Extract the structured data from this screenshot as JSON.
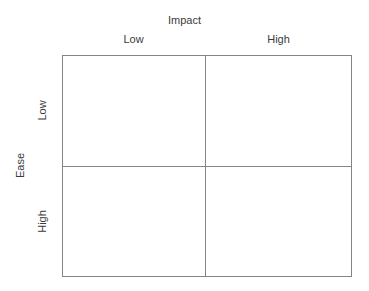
{
  "chart_data": {
    "type": "table",
    "title": "",
    "xlabel": "Impact",
    "ylabel": "Ease",
    "x_categories": [
      "Low",
      "High"
    ],
    "y_categories": [
      "Low",
      "High"
    ],
    "grid": true,
    "legend": "none",
    "cells": [
      {
        "row": "Low",
        "col": "Low",
        "label": ""
      },
      {
        "row": "Low",
        "col": "High",
        "label": ""
      },
      {
        "row": "High",
        "col": "Low",
        "label": ""
      },
      {
        "row": "High",
        "col": "High",
        "label": ""
      }
    ],
    "line_color": "#858585",
    "text_color": "#3b3b3b",
    "background_color": "#ffffff"
  },
  "matrix": {
    "x_axis_title": "Impact",
    "y_axis_title": "Ease",
    "columns": [
      {
        "label": "Low"
      },
      {
        "label": "High"
      }
    ],
    "rows": [
      {
        "label": "Low"
      },
      {
        "label": "High"
      }
    ],
    "quadrants": [
      {
        "name": "low-impact-low-ease",
        "content": ""
      },
      {
        "name": "high-impact-low-ease",
        "content": ""
      },
      {
        "name": "low-impact-high-ease",
        "content": ""
      },
      {
        "name": "high-impact-high-ease",
        "content": ""
      }
    ]
  }
}
